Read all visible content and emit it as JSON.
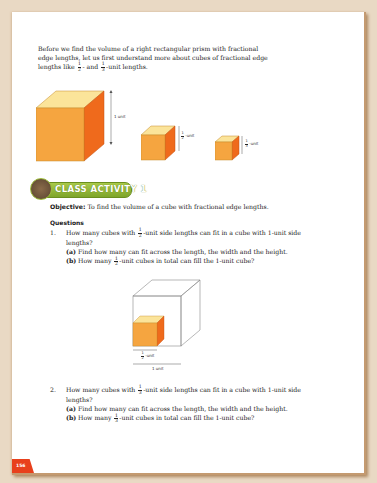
{
  "intro": {
    "line1": "Before we find the volume of a right rectangular prism with fractional",
    "line2": "edge lengths, let us first understand more about cubes of fractional edge",
    "line3_a": "lengths like",
    "line3_b": "- and",
    "line3_c": "-unit lengths.",
    "frac1": {
      "num": "1",
      "den": "2"
    },
    "frac2": {
      "num": "1",
      "den": "3"
    }
  },
  "cubes": {
    "big_label": "1 unit",
    "half_label_frac": {
      "num": "1",
      "den": "2"
    },
    "half_label": "-unit",
    "third_label_frac": {
      "num": "1",
      "den": "3"
    },
    "third_label": "-unit",
    "colors": {
      "front": "#f5a540",
      "top": "#fbe49a",
      "side": "#ef6a1c"
    }
  },
  "activity": {
    "banner": "CLASS ACTIVITY 1",
    "banner_color": "#8db33a",
    "objective_label": "Objective:",
    "objective_text": "To find the volume of a cube with fractional edge lengths.",
    "questions_heading": "Questions"
  },
  "questions": [
    {
      "number": "1.",
      "text_a": "How many cubes with",
      "frac": {
        "num": "1",
        "den": "2"
      },
      "text_b": "-unit side lengths can fit in a cube with 1-unit side",
      "text_c": "lengths?",
      "parts": [
        {
          "label": "(a)",
          "text": "Find how many can fit across the length, the width and the height."
        },
        {
          "label": "(b)",
          "text_a": "How many",
          "frac": {
            "num": "1",
            "den": "2"
          },
          "text_b": "-unit cubes in total can fill the 1-unit cube?"
        }
      ]
    },
    {
      "number": "2.",
      "text_a": "How many cubes with",
      "frac": {
        "num": "1",
        "den": "3"
      },
      "text_b": "-unit side lengths can fit in a cube with 1-unit side",
      "text_c": "lengths?",
      "parts": [
        {
          "label": "(a)",
          "text": "Find how many can fit across the length, the width and the height."
        },
        {
          "label": "(b)",
          "text_a": "How many",
          "frac": {
            "num": "1",
            "den": "3"
          },
          "text_b": "-unit cubes in total can fill the 1-unit cube?"
        }
      ]
    }
  ],
  "diagram": {
    "small_label_frac": {
      "num": "1",
      "den": "2"
    },
    "small_label": "-unit",
    "big_label": "1 unit"
  },
  "footer": {
    "page_number": "156",
    "page_badge_color": "#e8401c"
  }
}
